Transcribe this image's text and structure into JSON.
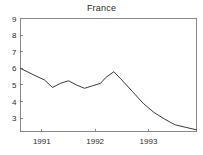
{
  "chart_data": {
    "type": "line",
    "title": "France",
    "xlabel": "",
    "ylabel": "",
    "grid": false,
    "legend": null,
    "ylim": [
      2.2,
      9.0
    ],
    "xlim": [
      1990.6,
      1993.9
    ],
    "ytick_labels": [
      "9",
      "8",
      "7",
      "6",
      "5",
      "4",
      "3"
    ],
    "ytick_values": [
      9,
      8,
      7,
      6,
      5,
      4,
      3
    ],
    "xtick_labels": [
      "1991",
      "1992",
      "1993"
    ],
    "xtick_values": [
      1991,
      1992,
      1993
    ],
    "series": [
      {
        "name": "France",
        "x": [
          1990.6,
          1990.85,
          1991.05,
          1991.2,
          1991.35,
          1991.5,
          1991.65,
          1991.8,
          1991.95,
          1992.1,
          1992.2,
          1992.35,
          1992.5,
          1992.7,
          1992.9,
          1993.1,
          1993.3,
          1993.5,
          1993.7,
          1993.9
        ],
        "values": [
          6.0,
          5.6,
          5.3,
          4.85,
          5.1,
          5.25,
          5.0,
          4.8,
          4.95,
          5.1,
          5.45,
          5.8,
          5.3,
          4.6,
          3.9,
          3.35,
          2.95,
          2.6,
          2.45,
          2.3
        ]
      }
    ]
  },
  "artifact": {
    "corner_text": ""
  }
}
